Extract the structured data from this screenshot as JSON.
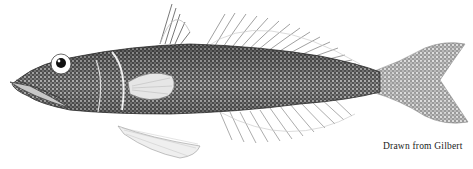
{
  "figure": {
    "caption": "Drawn from Gilbert",
    "colors": {
      "ink": "#1a1a1a",
      "paper": "#ffffff",
      "body_dark": "#3a3a3a",
      "body_mid": "#7a7a7a",
      "fin": "#9a9a9a"
    }
  }
}
